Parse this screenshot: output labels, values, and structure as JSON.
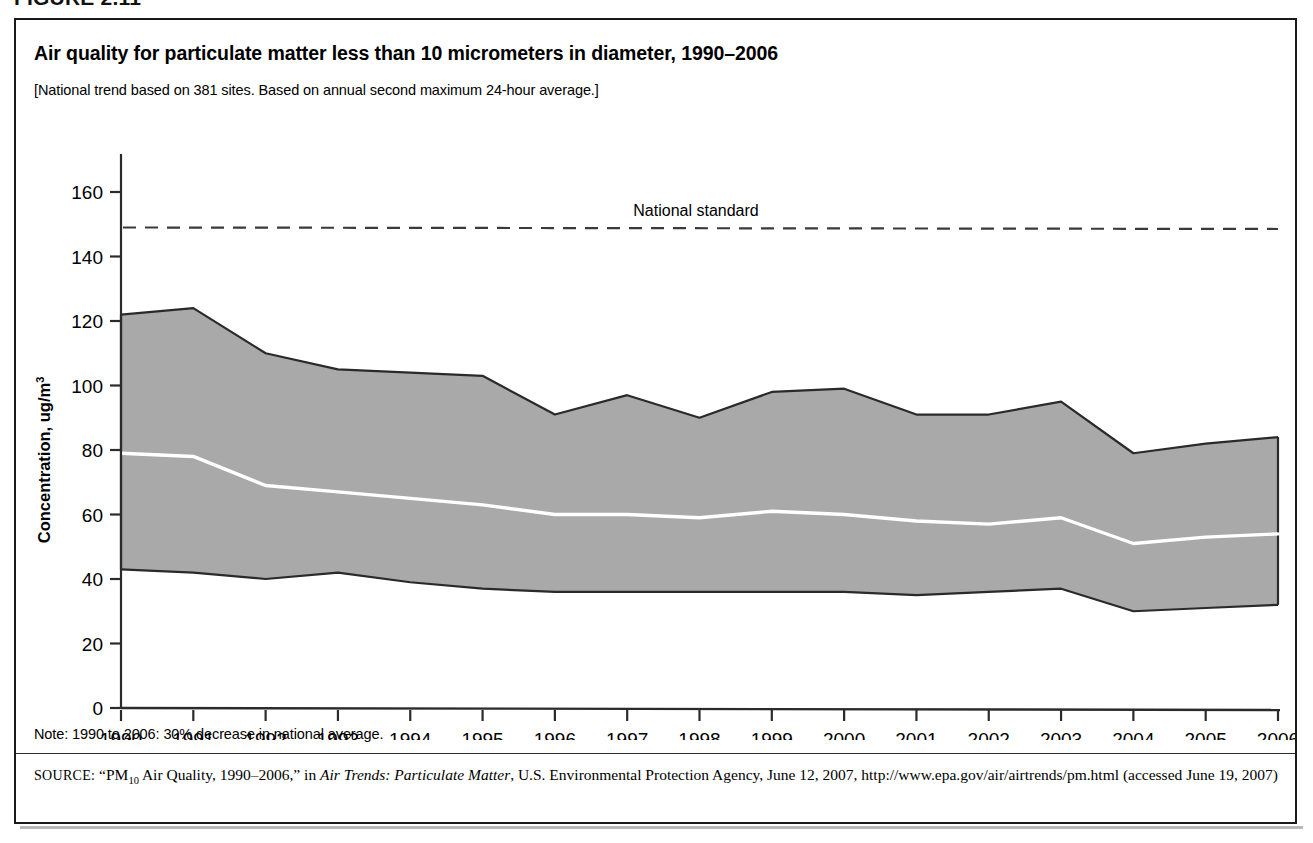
{
  "figure": {
    "number_label": "FIGURE 2.11",
    "title": "Air quality for particulate matter less than 10 micrometers in diameter, 1990–2006",
    "subtitle": "[National trend based on 381 sites. Based on annual second maximum 24-hour average.]",
    "note": "Note: 1990 to 2006: 30% decrease in national average.",
    "source_label": "SOURCE:",
    "source_part1": "“PM",
    "source_sub": "10",
    "source_part2": " Air Quality, 1990–2006,” in ",
    "source_italic": "Air Trends: Particulate Matter",
    "source_part3": ", U.S. Environmental Protection Agency, June 12, 2007, http://www.epa.gov/air/airtrends/pm.html (accessed June 19, 2007)"
  },
  "colors": {
    "band_fill": "#a9a9a9",
    "band_outline": "#2a2a2a",
    "mean_line": "#ffffff",
    "standard_line": "#3a3a3a",
    "axis": "#2b2b2b",
    "text": "#000000",
    "border": "#1a1a1a"
  },
  "chart_data": {
    "type": "area",
    "title": "Air quality for particulate matter less than 10 micrometers in diameter, 1990–2006",
    "subtitle": "[National trend based on 381 sites. Based on annual second maximum 24-hour average.]",
    "xlabel": "",
    "ylabel": "Concentration, ug/m",
    "ylabel_exponent": "3",
    "xlim": [
      1990,
      2006
    ],
    "ylim": [
      0,
      160
    ],
    "ytick_step": 20,
    "yticks": [
      0,
      20,
      40,
      60,
      80,
      100,
      120,
      140,
      160
    ],
    "xticks": [
      1990,
      1991,
      1992,
      1993,
      1994,
      1995,
      1996,
      1997,
      1998,
      1999,
      2000,
      2001,
      2002,
      2003,
      2004,
      2005,
      2006
    ],
    "x": [
      1990,
      1991,
      1992,
      1993,
      1994,
      1995,
      1996,
      1997,
      1998,
      1999,
      2000,
      2001,
      2002,
      2003,
      2004,
      2005,
      2006
    ],
    "grid": false,
    "legend": "none",
    "series": [
      {
        "name": "90th percentile (upper bound)",
        "role": "band_max",
        "values": [
          122,
          124,
          110,
          105,
          104,
          103,
          91,
          97,
          90,
          98,
          99,
          91,
          91,
          95,
          79,
          82,
          84
        ]
      },
      {
        "name": "National average (mean)",
        "role": "mean_line",
        "values": [
          79,
          78,
          69,
          67,
          65,
          63,
          60,
          60,
          59,
          61,
          60,
          58,
          57,
          59,
          51,
          53,
          54
        ]
      },
      {
        "name": "10th percentile (lower bound)",
        "role": "band_min",
        "values": [
          43,
          42,
          40,
          42,
          39,
          37,
          36,
          36,
          36,
          36,
          36,
          35,
          36,
          37,
          30,
          31,
          32
        ]
      }
    ],
    "annotations": [
      {
        "name": "national-standard",
        "label": "National standard",
        "value": 149,
        "style": "dashed-horizontal-line"
      }
    ]
  }
}
